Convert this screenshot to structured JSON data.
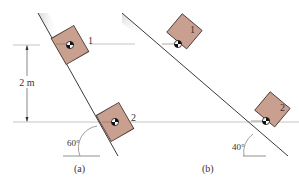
{
  "colors": {
    "block_fill": "#c9a090",
    "block_stroke": "#4a3a34",
    "incline_line": "#3a3a3a",
    "guide_line": "#b8b8b8",
    "shade_start": "#d9d9d9",
    "shade_end": "#ffffff"
  },
  "panel_a": {
    "caption": "(a)",
    "angle_label": "60°",
    "dimension_label": "2 m",
    "block1_label": "1",
    "block2_label": "2"
  },
  "panel_b": {
    "caption": "(b)",
    "angle_label": "40°",
    "block1_label": "1",
    "block2_label": "2"
  }
}
